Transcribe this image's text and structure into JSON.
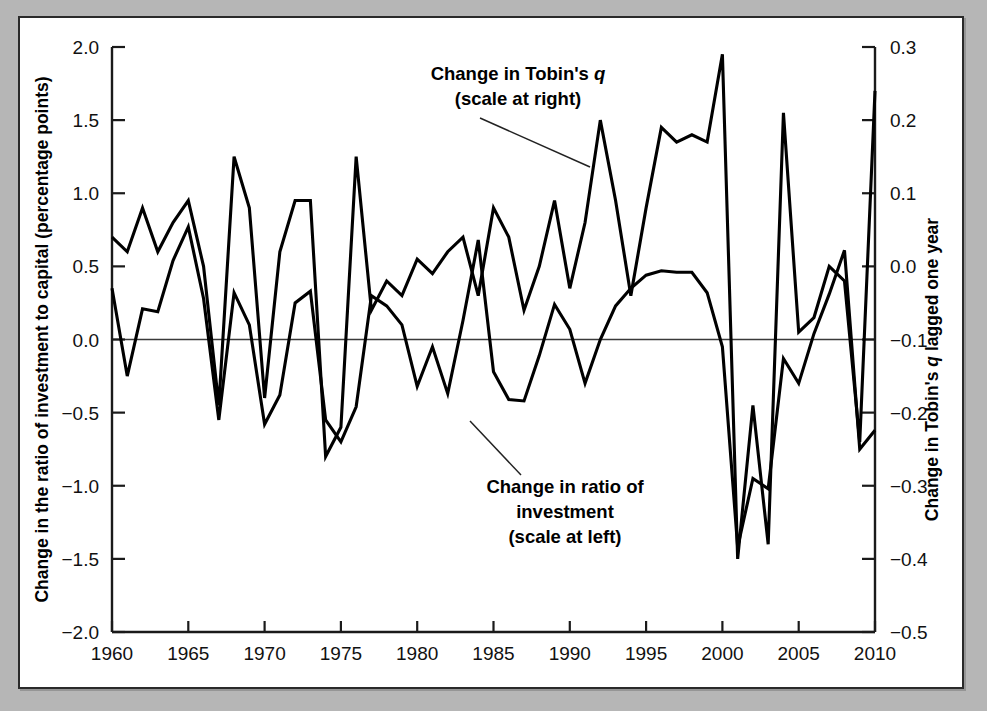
{
  "figure": {
    "background": "#b6b6b6",
    "card_background": "#ffffff",
    "border_color": "#2a2a2a",
    "line_color": "#000000"
  },
  "chart_data": {
    "type": "line",
    "title": "",
    "xlabel": "",
    "ylabel": "Change in the ratio of investment to capital (percentage points)",
    "y2label": "Change in Tobin's q lagged one year",
    "grid": false,
    "legend_position": "inline-annotations",
    "xlim": [
      1960,
      2010
    ],
    "ylim": [
      -2.0,
      2.0
    ],
    "y2lim": [
      -0.5,
      0.3
    ],
    "xticks": [
      1960,
      1965,
      1970,
      1975,
      1980,
      1985,
      1990,
      1995,
      2000,
      2005,
      2010
    ],
    "xticklabels": [
      "1960",
      "1965",
      "1970",
      "1975",
      "1980",
      "1985",
      "1990",
      "1995",
      "2000",
      "2005",
      "2010"
    ],
    "yticks": [
      2.0,
      1.5,
      1.0,
      0.5,
      0.0,
      -0.5,
      -1.0,
      -1.5,
      -2.0
    ],
    "yticklabels": [
      "2.0",
      "1.5",
      "1.0",
      "0.5",
      "0.0",
      "−0.5",
      "−1.0",
      "−1.5",
      "−2.0"
    ],
    "y2ticks": [
      0.3,
      0.2,
      0.1,
      0.0,
      -0.1,
      -0.2,
      -0.3,
      -0.4,
      -0.5
    ],
    "y2ticklabels": [
      "0.3",
      "0.2",
      "0.1",
      "0.0",
      "−0.1",
      "−0.2",
      "−0.3",
      "−0.4",
      "−0.5"
    ],
    "x": [
      1960,
      1961,
      1962,
      1963,
      1964,
      1965,
      1966,
      1967,
      1968,
      1969,
      1970,
      1971,
      1972,
      1973,
      1974,
      1975,
      1976,
      1977,
      1978,
      1979,
      1980,
      1981,
      1982,
      1983,
      1984,
      1985,
      1986,
      1987,
      1988,
      1989,
      1990,
      1991,
      1992,
      1993,
      1994,
      1995,
      1996,
      1997,
      1998,
      1999,
      2000,
      2001,
      2002,
      2003,
      2004,
      2005,
      2006,
      2007,
      2008,
      2009,
      2010
    ],
    "series": [
      {
        "name": "Change in Tobin's q lagged one year",
        "axis": "right",
        "units": "change in q",
        "values_right_axis": [
          0.04,
          0.02,
          0.08,
          0.02,
          0.06,
          0.09,
          0.0,
          -0.19,
          0.15,
          0.08,
          -0.18,
          0.02,
          0.09,
          0.09,
          -0.26,
          -0.22,
          0.15,
          -0.06,
          -0.02,
          -0.04,
          0.01,
          -0.01,
          0.02,
          0.04,
          -0.04,
          0.08,
          0.04,
          -0.06,
          0.0,
          0.09,
          -0.03,
          0.06,
          0.2,
          0.09,
          -0.04,
          0.08,
          0.19,
          0.17,
          0.18,
          0.17,
          0.29,
          -0.4,
          -0.19,
          -0.38,
          0.21,
          -0.09,
          -0.07,
          0.0,
          -0.02,
          -0.24,
          0.24
        ],
        "values_left_axis_equivalent": [
          0.71,
          0.53,
          0.82,
          0.53,
          0.76,
          0.95,
          0.46,
          -0.46,
          1.25,
          0.9,
          -0.38,
          0.55,
          0.95,
          0.94,
          -0.9,
          -0.53,
          1.24,
          0.12,
          0.52,
          0.54,
          0.42,
          0.54,
          0.65,
          0.67,
          0.49,
          0.88,
          0.68,
          0.25,
          0.47,
          0.95,
          0.38,
          0.76,
          1.47,
          0.9,
          0.54,
          0.88,
          1.43,
          1.31,
          1.35,
          1.3,
          1.93,
          -1.5,
          -0.45,
          -1.43,
          1.53,
          -0.11,
          -0.03,
          0.49,
          0.65,
          -0.62,
          1.66
        ]
      },
      {
        "name": "Change in ratio of investment",
        "axis": "left",
        "units": "percentage points",
        "values": [
          0.35,
          -0.25,
          0.21,
          0.19,
          0.54,
          0.77,
          0.28,
          -0.55,
          0.32,
          0.1,
          -0.58,
          -0.38,
          0.25,
          0.33,
          -0.55,
          -0.7,
          -0.46,
          0.3,
          0.23,
          0.1,
          -0.32,
          -0.05,
          -0.37,
          0.13,
          0.68,
          -0.22,
          -0.41,
          -0.42,
          -0.11,
          0.24,
          0.07,
          -0.3,
          0.0,
          0.23,
          0.35,
          0.44,
          0.47,
          0.46,
          0.46,
          0.32,
          -0.05,
          -1.42,
          -0.95,
          -1.02,
          -0.13,
          -0.3,
          0.04,
          0.31,
          0.61,
          -0.75,
          -0.62
        ]
      }
    ]
  },
  "annotations": [
    {
      "id": "tobins-q",
      "line1_pre": "Change in Tobin's ",
      "line1_italic": "q",
      "line2": "(scale at right)",
      "x": 498,
      "y": 62
    },
    {
      "id": "investment-ratio",
      "line1": "Change in ratio of",
      "line2": "investment",
      "line3": "(scale at left)",
      "x": 545,
      "y": 475
    }
  ]
}
